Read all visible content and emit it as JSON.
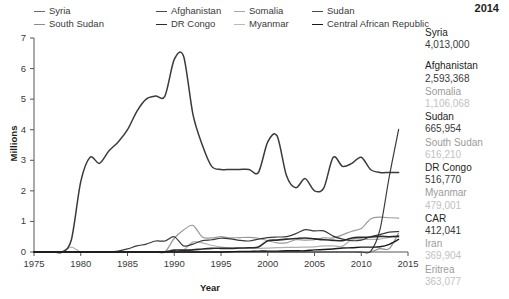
{
  "chart_data": {
    "type": "line",
    "title": "",
    "xlabel": "Year",
    "ylabel": "Millions",
    "xlim": [
      1975,
      2015
    ],
    "ylim": [
      0,
      7
    ],
    "xticks": [
      "1975",
      "1980",
      "1985",
      "1990",
      "1995",
      "2000",
      "2005",
      "2010",
      "2015"
    ],
    "yticks": [
      "0",
      "1",
      "2",
      "3",
      "4",
      "5",
      "6",
      "7"
    ],
    "grid": false,
    "legend_position": "top",
    "units": "Millions of refugees",
    "x": [
      1975,
      1976,
      1977,
      1978,
      1979,
      1980,
      1981,
      1982,
      1983,
      1984,
      1985,
      1986,
      1987,
      1988,
      1989,
      1990,
      1991,
      1992,
      1993,
      1994,
      1995,
      1996,
      1997,
      1998,
      1999,
      2000,
      2001,
      2002,
      2003,
      2004,
      2005,
      2006,
      2007,
      2008,
      2009,
      2010,
      2011,
      2012,
      2013,
      2014
    ],
    "series": [
      {
        "name": "Afghanistan",
        "color": "#3a3a3a",
        "width": 1.5,
        "values": [
          0.0,
          0.0,
          0.0,
          0.0,
          0.4,
          2.3,
          3.1,
          2.9,
          3.3,
          3.6,
          4.0,
          4.6,
          5.0,
          5.1,
          5.1,
          6.3,
          6.4,
          4.5,
          3.5,
          2.8,
          2.7,
          2.7,
          2.7,
          2.7,
          2.6,
          3.6,
          3.8,
          2.5,
          2.1,
          2.4,
          2.0,
          2.1,
          3.1,
          2.8,
          2.9,
          3.1,
          2.7,
          2.6,
          2.6,
          2.6
        ]
      },
      {
        "name": "Syria",
        "color": "#3a3a3a",
        "width": 1.2,
        "values": [
          0.0,
          0.0,
          0.0,
          0.0,
          0.0,
          0.0,
          0.0,
          0.0,
          0.0,
          0.0,
          0.0,
          0.0,
          0.0,
          0.0,
          0.0,
          0.0,
          0.0,
          0.0,
          0.0,
          0.0,
          0.0,
          0.0,
          0.0,
          0.0,
          0.0,
          0.0,
          0.0,
          0.0,
          0.0,
          0.0,
          0.0,
          0.0,
          0.0,
          0.0,
          0.0,
          0.0,
          0.02,
          0.73,
          2.47,
          4.01
        ]
      },
      {
        "name": "Somalia",
        "color": "#9a9a9a",
        "width": 1.2,
        "values": [
          0.0,
          0.0,
          0.0,
          0.0,
          0.0,
          0.0,
          0.0,
          0.0,
          0.0,
          0.0,
          0.0,
          0.0,
          0.0,
          0.0,
          0.0,
          0.45,
          0.72,
          0.87,
          0.49,
          0.46,
          0.5,
          0.46,
          0.47,
          0.48,
          0.45,
          0.37,
          0.3,
          0.3,
          0.4,
          0.39,
          0.4,
          0.46,
          0.46,
          0.56,
          0.68,
          0.77,
          1.08,
          1.14,
          1.12,
          1.11
        ]
      },
      {
        "name": "Sudan",
        "color": "#3a3a3a",
        "width": 1.2,
        "values": [
          0.0,
          0.0,
          0.0,
          0.0,
          0.0,
          0.0,
          0.0,
          0.0,
          0.0,
          0.03,
          0.1,
          0.2,
          0.26,
          0.36,
          0.36,
          0.5,
          0.2,
          0.26,
          0.37,
          0.4,
          0.45,
          0.43,
          0.38,
          0.36,
          0.42,
          0.47,
          0.49,
          0.5,
          0.6,
          0.73,
          0.69,
          0.69,
          0.52,
          0.42,
          0.37,
          0.39,
          0.5,
          0.57,
          0.65,
          0.67
        ]
      },
      {
        "name": "South Sudan",
        "color": "#8c8c8c",
        "width": 1.2,
        "values": [
          0.0,
          0.0,
          0.0,
          0.0,
          0.0,
          0.0,
          0.0,
          0.0,
          0.0,
          0.0,
          0.0,
          0.0,
          0.0,
          0.0,
          0.0,
          0.0,
          0.0,
          0.0,
          0.0,
          0.0,
          0.0,
          0.0,
          0.0,
          0.0,
          0.0,
          0.0,
          0.0,
          0.0,
          0.0,
          0.0,
          0.0,
          0.0,
          0.0,
          0.0,
          0.0,
          0.0,
          0.0,
          0.11,
          0.11,
          0.62
        ]
      },
      {
        "name": "DR Congo",
        "color": "#2a2a2a",
        "width": 1.6,
        "values": [
          0.0,
          0.0,
          0.0,
          0.0,
          0.0,
          0.0,
          0.0,
          0.0,
          0.0,
          0.0,
          0.0,
          0.0,
          0.0,
          0.0,
          0.0,
          0.06,
          0.06,
          0.07,
          0.1,
          0.12,
          0.12,
          0.12,
          0.13,
          0.14,
          0.16,
          0.37,
          0.39,
          0.42,
          0.44,
          0.46,
          0.43,
          0.4,
          0.38,
          0.37,
          0.46,
          0.48,
          0.49,
          0.51,
          0.5,
          0.52
        ]
      },
      {
        "name": "Myanmar",
        "color": "#b0b0b0",
        "width": 1.2,
        "values": [
          0.0,
          0.0,
          0.0,
          0.0,
          0.16,
          0.0,
          0.0,
          0.0,
          0.0,
          0.0,
          0.0,
          0.0,
          0.0,
          0.0,
          0.0,
          0.0,
          0.06,
          0.33,
          0.3,
          0.22,
          0.16,
          0.13,
          0.12,
          0.12,
          0.12,
          0.13,
          0.14,
          0.15,
          0.15,
          0.16,
          0.17,
          0.2,
          0.2,
          0.19,
          0.41,
          0.42,
          0.41,
          0.42,
          0.48,
          0.48
        ]
      },
      {
        "name": "Central African Republic",
        "color": "#1a1a1a",
        "width": 1.4,
        "values": [
          0.0,
          0.0,
          0.0,
          0.0,
          0.0,
          0.0,
          0.0,
          0.0,
          0.0,
          0.0,
          0.0,
          0.0,
          0.0,
          0.0,
          0.0,
          0.0,
          0.0,
          0.0,
          0.0,
          0.0,
          0.0,
          0.01,
          0.02,
          0.02,
          0.03,
          0.03,
          0.03,
          0.04,
          0.04,
          0.04,
          0.07,
          0.08,
          0.1,
          0.13,
          0.14,
          0.16,
          0.16,
          0.17,
          0.25,
          0.41
        ]
      }
    ]
  },
  "legend": {
    "items": [
      {
        "label": "Syria",
        "color": "#6e6e6e"
      },
      {
        "label": "Afghanistan",
        "color": "#4a4a4a"
      },
      {
        "label": "Somalia",
        "color": "#a8a8a8"
      },
      {
        "label": "Sudan",
        "color": "#4a4a4a"
      },
      {
        "label": "South Sudan",
        "color": "#8c8c8c"
      },
      {
        "label": "DR Congo",
        "color": "#2a2a2a"
      },
      {
        "label": "Myanmar",
        "color": "#b8b8b8"
      },
      {
        "label": "Central African Republic",
        "color": "#1a1a1a"
      }
    ]
  },
  "side_panel": {
    "year": "2014",
    "entries": [
      {
        "name": "Syria",
        "value": "4,013,000",
        "shade": "dark"
      },
      {
        "name": "Afghanistan",
        "value": "2,593,368",
        "shade": "dark"
      },
      {
        "name": "Somalia",
        "value": "1,106,068",
        "shade": "light"
      },
      {
        "name": "Sudan",
        "value": "665,954",
        "shade": "dark"
      },
      {
        "name": "South Sudan",
        "value": "616,210",
        "shade": "light"
      },
      {
        "name": "DR Congo",
        "value": "516,770",
        "shade": "dark"
      },
      {
        "name": "Myanmar",
        "value": "479,001",
        "shade": "light"
      },
      {
        "name": "CAR",
        "value": "412,041",
        "shade": "dark"
      },
      {
        "name": "Iran",
        "value": "369,904",
        "shade": "light"
      },
      {
        "name": "Eritrea",
        "value": "363,077",
        "shade": "light"
      }
    ]
  }
}
